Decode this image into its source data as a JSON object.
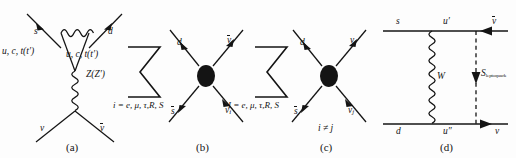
{
  "figure": {
    "caption_tags": [
      "(a)",
      "(b)",
      "(c)",
      "(d)"
    ],
    "background_color": "#fdfdfd",
    "ink_color": "#141414"
  },
  "panel_a": {
    "tag": "(a)",
    "incoming_quark": "s",
    "outgoing_quark": "d",
    "loop_left": "u, c, t(t′)",
    "loop_right": "u, c, t(t′)",
    "propagator": "Z(Z′)",
    "neutrino": "ν",
    "antineutrino_base": "ν",
    "antineutrino_display": "ν̄",
    "boson_line": "wavy-photon-line",
    "propagator_line": "wavy-z-line"
  },
  "panel_b": {
    "tag": "(b)",
    "sum_symbol": "∑",
    "sum_subscript": "i = e, μ, τ,R, S",
    "in_quark": "d",
    "out_quark_base": "s",
    "out_quark_display": "s̄",
    "out_neutrino_base": "ν",
    "out_neutrino_sub": "i",
    "in_antineutrino_base": "ν̄",
    "in_antineutrino_sub": "i",
    "vertex": "filled-blob"
  },
  "panel_c": {
    "tag": "(c)",
    "sum_symbol": "∑",
    "sum_subscript": "I = e, μ, τ,R, S",
    "condition": "i ≠ j",
    "in_quark": "d",
    "out_quark_base": "s",
    "out_quark_display": "s̄",
    "out_neutrino_base": "ν",
    "out_neutrino_sub": "i",
    "in_antineutrino_base": "ν̄",
    "in_antineutrino_sub": "j",
    "vertex": "filled-blob"
  },
  "panel_d": {
    "tag": "(d)",
    "top_left": "s",
    "top_mid": "u′",
    "top_right_display": "ν̄",
    "bottom_left": "d",
    "bottom_mid": "u″",
    "bottom_right": "ν",
    "w_boson": "W",
    "scalar_base": "S",
    "scalar_subscript": "leptoquark",
    "wavy_line": "wavy-w-line",
    "dashed_line": "dashed-scalar-line"
  }
}
